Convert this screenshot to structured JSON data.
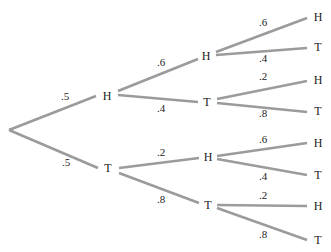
{
  "diagram": {
    "type": "probability-tree",
    "line_color": "#9b9b9b",
    "text_color": "#222222",
    "root": {
      "x": 9,
      "y": 130
    },
    "nodes": [
      {
        "id": "n1H",
        "label": "H",
        "x": 107,
        "y": 96,
        "parent": "root",
        "prob": ".5",
        "prob_x": 61,
        "prob_y": 100,
        "edge_end_x": 96,
        "edge_end_y": 96
      },
      {
        "id": "n1T",
        "label": "T",
        "x": 108,
        "y": 168,
        "parent": "root",
        "prob": ".5",
        "prob_x": 62,
        "prob_y": 166,
        "edge_end_x": 98,
        "edge_end_y": 168
      },
      {
        "id": "n2HH",
        "label": "H",
        "x": 206,
        "y": 56,
        "parent": "n1H",
        "prob": ".6",
        "prob_x": 157,
        "prob_y": 66,
        "edge_start_x": 118,
        "edge_start_y": 91,
        "edge_end_x": 198,
        "edge_end_y": 59
      },
      {
        "id": "n2HT",
        "label": "T",
        "x": 207,
        "y": 102,
        "parent": "n1H",
        "prob": ".4",
        "prob_x": 157,
        "prob_y": 112,
        "edge_start_x": 118,
        "edge_start_y": 95,
        "edge_end_x": 198,
        "edge_end_y": 102
      },
      {
        "id": "n2TH",
        "label": "H",
        "x": 208,
        "y": 157,
        "parent": "n1T",
        "prob": ".2",
        "prob_x": 157,
        "prob_y": 156,
        "edge_start_x": 119,
        "edge_start_y": 168,
        "edge_end_x": 199,
        "edge_end_y": 158
      },
      {
        "id": "n2TT",
        "label": "T",
        "x": 208,
        "y": 205,
        "parent": "n1T",
        "prob": ".8",
        "prob_x": 157,
        "prob_y": 203,
        "edge_start_x": 119,
        "edge_start_y": 173,
        "edge_end_x": 199,
        "edge_end_y": 203
      },
      {
        "id": "n3HHH",
        "label": "H",
        "x": 318,
        "y": 17,
        "parent": "n2HH",
        "prob": ".6",
        "prob_x": 259,
        "prob_y": 26,
        "edge_start_x": 216,
        "edge_start_y": 52,
        "edge_end_x": 307,
        "edge_end_y": 18
      },
      {
        "id": "n3HHT",
        "label": "T",
        "x": 318,
        "y": 47,
        "parent": "n2HH",
        "prob": ".4",
        "prob_x": 259,
        "prob_y": 62,
        "edge_start_x": 216,
        "edge_start_y": 55,
        "edge_end_x": 307,
        "edge_end_y": 48
      },
      {
        "id": "n3HTH",
        "label": "H",
        "x": 318,
        "y": 80,
        "parent": "n2HT",
        "prob": ".2",
        "prob_x": 259,
        "prob_y": 80,
        "edge_start_x": 217,
        "edge_start_y": 99,
        "edge_end_x": 307,
        "edge_end_y": 81
      },
      {
        "id": "n3HTT",
        "label": "T",
        "x": 318,
        "y": 111,
        "parent": "n2HT",
        "prob": ".8",
        "prob_x": 259,
        "prob_y": 117,
        "edge_start_x": 217,
        "edge_start_y": 103,
        "edge_end_x": 307,
        "edge_end_y": 112
      },
      {
        "id": "n3THH",
        "label": "H",
        "x": 318,
        "y": 143,
        "parent": "n2TH",
        "prob": ".6",
        "prob_x": 259,
        "prob_y": 143,
        "edge_start_x": 217,
        "edge_start_y": 156,
        "edge_end_x": 307,
        "edge_end_y": 143
      },
      {
        "id": "n3THT",
        "label": "T",
        "x": 318,
        "y": 175,
        "parent": "n2TH",
        "prob": ".4",
        "prob_x": 259,
        "prob_y": 180,
        "edge_start_x": 217,
        "edge_start_y": 159,
        "edge_end_x": 307,
        "edge_end_y": 175
      },
      {
        "id": "n3TTH",
        "label": "H",
        "x": 318,
        "y": 206,
        "parent": "n2TT",
        "prob": ".2",
        "prob_x": 259,
        "prob_y": 199,
        "edge_start_x": 217,
        "edge_start_y": 205,
        "edge_end_x": 307,
        "edge_end_y": 206
      },
      {
        "id": "n3TTT",
        "label": "T",
        "x": 318,
        "y": 240,
        "parent": "n2TT",
        "prob": ".8",
        "prob_x": 259,
        "prob_y": 238,
        "edge_start_x": 217,
        "edge_start_y": 208,
        "edge_end_x": 307,
        "edge_end_y": 240
      }
    ]
  }
}
